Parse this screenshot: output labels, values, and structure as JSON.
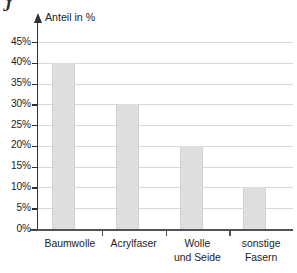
{
  "chart_data": {
    "type": "bar",
    "title": "",
    "subtitle": "",
    "xlabel": "",
    "ylabel": "Anteil in %",
    "categories": [
      "Baumwolle",
      "Acrylfaser",
      "Wolle\nund Seide",
      "sonstige\nFasern"
    ],
    "values": [
      40,
      30,
      20,
      10
    ],
    "value_labels": [
      "40%",
      "30%",
      "20%",
      "10%"
    ],
    "ylim": [
      0,
      45
    ],
    "ytick_values": [
      0,
      5,
      10,
      15,
      20,
      25,
      30,
      35,
      40,
      45
    ],
    "ytick_labels": [
      "0%",
      "5%",
      "10%",
      "15%",
      "20%",
      "25%",
      "30%",
      "35%",
      "40%",
      "45%"
    ],
    "grid": true,
    "grid_axis": "y",
    "legend": false,
    "legend_position": "none",
    "bar_color": "#dedede",
    "gridline_color": "#d7d7d7",
    "axis_color": "#33312f",
    "text_color": "#1e1c1b",
    "y_axis_arrow": true
  },
  "artifact": {
    "mark": "J"
  }
}
